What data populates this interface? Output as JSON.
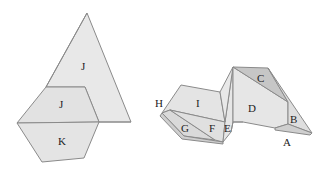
{
  "colors": {
    "background": "#ffffff",
    "face_light": "#e6e6e6",
    "face_mid": "#dcdcdc",
    "face_dark": "#c4c4c4",
    "edge": "#8a8a8a",
    "label": "#222222"
  },
  "left_figure": {
    "labels": {
      "J_upper": "J",
      "J_lower": "J",
      "K": "K"
    }
  },
  "right_figure": {
    "labels": {
      "A": "A",
      "B": "B",
      "C": "C",
      "D": "D",
      "E": "E",
      "F": "F",
      "G": "G",
      "H": "H",
      "I": "I"
    }
  }
}
